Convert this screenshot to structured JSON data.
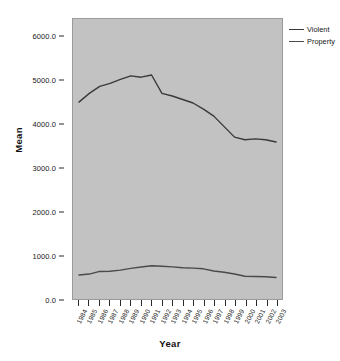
{
  "chart_data": {
    "type": "line",
    "title": "",
    "xlabel": "Year",
    "ylabel": "Mean",
    "grid": false,
    "legend_position": "right",
    "x": [
      1984,
      1985,
      1986,
      1987,
      1988,
      1989,
      1990,
      1991,
      1992,
      1993,
      1994,
      1995,
      1996,
      1997,
      1998,
      1999,
      2000,
      2001,
      2002,
      2003
    ],
    "categories": [
      "1984",
      "1985",
      "1986",
      "1987",
      "1988",
      "1989",
      "1990",
      "1991",
      "1992",
      "1993",
      "1994",
      "1995",
      "1996",
      "1997",
      "1998",
      "1999",
      "2000",
      "2001",
      "2002",
      "2003"
    ],
    "xlim": [
      1984,
      2003
    ],
    "ylim": [
      0.0,
      6400.0
    ],
    "ytick_labels": [
      "0.0",
      "1000.0",
      "2000.0",
      "3000.0",
      "4000.0",
      "5000.0",
      "6000.0"
    ],
    "ytick_values": [
      0,
      1000,
      2000,
      3000,
      4000,
      5000,
      6000
    ],
    "series": [
      {
        "name": "Violent",
        "color": "#3a3a3a",
        "values": [
          4500,
          4700,
          4860,
          4930,
          5020,
          5100,
          5070,
          5120,
          4700,
          4640,
          4560,
          4480,
          4340,
          4180,
          3940,
          3700,
          3640,
          3660,
          3640,
          3590
        ]
      },
      {
        "name": "Property",
        "color": "#4a4a4a",
        "values": [
          550,
          570,
          630,
          635,
          660,
          700,
          730,
          760,
          750,
          735,
          715,
          705,
          690,
          640,
          610,
          570,
          520,
          515,
          510,
          490
        ]
      }
    ]
  },
  "legend": {
    "items": [
      {
        "label": "Violent"
      },
      {
        "label": "Property"
      }
    ]
  },
  "axes": {
    "y_title": "Mean",
    "x_title": "Year"
  },
  "colors": {
    "panel_background": "#c2c2c2",
    "panel_border": "#9a9a9a",
    "page_background": "#ffffff",
    "violent_line": "#3a3a3a",
    "property_line": "#4a4a4a",
    "axis_text": "#202020",
    "title_text": "#101010"
  }
}
